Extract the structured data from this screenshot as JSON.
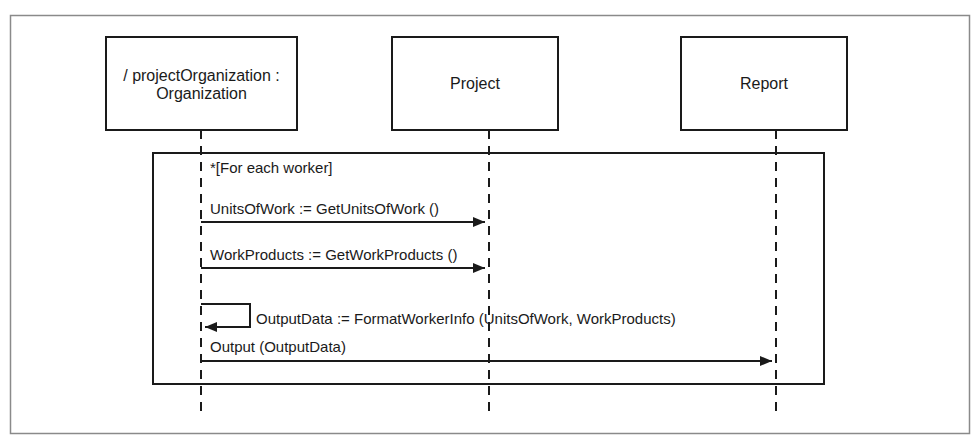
{
  "diagram": {
    "type": "UML sequence diagram",
    "colors": {
      "ink": "#1a1a1a",
      "frame": "#8a8a8a",
      "background": "#ffffff"
    },
    "lifelines": [
      {
        "id": "org",
        "label_lines": [
          "/ projectOrganization :",
          "Organization"
        ]
      },
      {
        "id": "project",
        "label_lines": [
          "Project"
        ]
      },
      {
        "id": "report",
        "label_lines": [
          "Report"
        ]
      }
    ],
    "loop": {
      "guard": "*[For each worker]"
    },
    "messages": [
      {
        "from": "org",
        "to": "project",
        "label": "UnitsOfWork := GetUnitsOfWork ()"
      },
      {
        "from": "org",
        "to": "project",
        "label": "WorkProducts := GetWorkProducts ()"
      },
      {
        "from": "org",
        "to": "org",
        "label": "OutputData := FormatWorkerInfo (UnitsOfWork, WorkProducts)"
      },
      {
        "from": "org",
        "to": "report",
        "label": "Output (OutputData)"
      }
    ]
  }
}
